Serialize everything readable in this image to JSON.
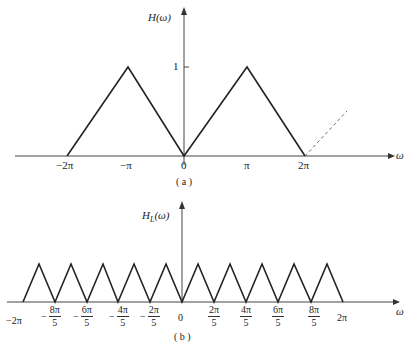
{
  "figure_a": {
    "y_label": "H(ω)",
    "x_label": "ω",
    "caption": "( a )",
    "y_tick": "1",
    "x_ticks": [
      "−2π",
      "−π",
      "0",
      "π",
      "2π"
    ],
    "polyline_points": [
      [
        -2,
        0
      ],
      [
        -1,
        1
      ],
      [
        0,
        0
      ],
      [
        1,
        1
      ],
      [
        2,
        0
      ]
    ],
    "dashed_continuation": [
      [
        2,
        0
      ],
      [
        2.6,
        0.6
      ]
    ]
  },
  "figure_b": {
    "y_label_main": "H",
    "y_label_sub": "L",
    "y_label_arg": "(ω)",
    "x_label": "ω",
    "caption": "( b )",
    "x_ticks": {
      "m2pi": "−2π",
      "m8": {
        "sign": "−",
        "num": "8π",
        "den": "5"
      },
      "m6": {
        "sign": "−",
        "num": "6π",
        "den": "5"
      },
      "m4": {
        "sign": "−",
        "num": "4π",
        "den": "5"
      },
      "m2": {
        "sign": "−",
        "num": "2π",
        "den": "5"
      },
      "zero": "0",
      "p2": {
        "num": "2π",
        "den": "5"
      },
      "p4": {
        "num": "4π",
        "den": "5"
      },
      "p6": {
        "num": "6π",
        "den": "5"
      },
      "p8": {
        "num": "8π",
        "den": "5"
      },
      "p2pi": "2π"
    },
    "triangle_count": 10,
    "period": "2π/5"
  }
}
